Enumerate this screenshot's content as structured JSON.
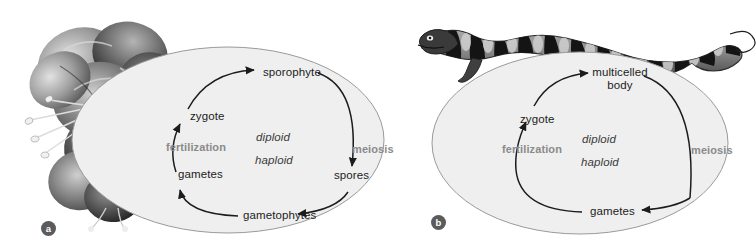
{
  "figure": {
    "background_color": "#ffffff",
    "ellipse_fill": "#efefef",
    "ellipse_stroke": "#9a9a9a",
    "arrow_color": "#1c1c1c",
    "process_text_color": "#8a8a8a",
    "stage_text_color": "#1c1c1c"
  },
  "panels": [
    {
      "badge": "a",
      "organism_icon": "azalea-flower-photo",
      "organism_name": "azalea flower cluster",
      "cycle_title": "plant alternation of generations",
      "ploidy": {
        "diploid": "diploid",
        "haploid": "haploid"
      },
      "stages": [
        {
          "id": "sporophyte",
          "label": "sporophyte"
        },
        {
          "id": "spores",
          "label": "spores"
        },
        {
          "id": "gametophytes",
          "label": "gametophytes"
        },
        {
          "id": "gametes",
          "label": "gametes"
        },
        {
          "id": "zygote",
          "label": "zygote"
        }
      ],
      "processes": [
        {
          "id": "meiosis",
          "label": "meiosis"
        },
        {
          "id": "fertilization",
          "label": "fertilization"
        }
      ]
    },
    {
      "badge": "b",
      "organism_icon": "salamander-photo",
      "organism_name": "tiger salamander",
      "cycle_title": "animal life cycle",
      "ploidy": {
        "diploid": "diploid",
        "haploid": "haploid"
      },
      "stages": [
        {
          "id": "multicelled-body",
          "label": "multicelled",
          "label2": "body"
        },
        {
          "id": "gametes",
          "label": "gametes"
        },
        {
          "id": "zygote",
          "label": "zygote"
        }
      ],
      "processes": [
        {
          "id": "meiosis",
          "label": "meiosis"
        },
        {
          "id": "fertilization",
          "label": "fertilization"
        }
      ]
    }
  ]
}
